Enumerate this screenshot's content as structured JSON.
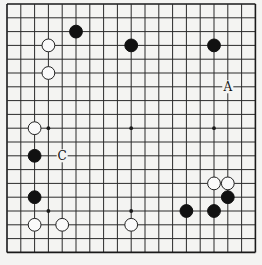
{
  "diagram": {
    "type": "go-board",
    "size": 19,
    "colors": {
      "background": "#f4f4f2",
      "line": "#2a2a2a",
      "black_stone": "#111111",
      "white_stone": "#fafafa"
    },
    "hoshi": [
      [
        3,
        3
      ],
      [
        9,
        3
      ],
      [
        15,
        3
      ],
      [
        3,
        9
      ],
      [
        9,
        9
      ],
      [
        15,
        9
      ],
      [
        3,
        15
      ],
      [
        9,
        15
      ],
      [
        15,
        15
      ]
    ],
    "stones": [
      {
        "color": "black",
        "col": 5,
        "row": 2
      },
      {
        "color": "white",
        "col": 3,
        "row": 3
      },
      {
        "color": "white",
        "col": 3,
        "row": 5
      },
      {
        "color": "black",
        "col": 9,
        "row": 3
      },
      {
        "color": "black",
        "col": 15,
        "row": 3
      },
      {
        "color": "white",
        "col": 2,
        "row": 9
      },
      {
        "color": "black",
        "col": 2,
        "row": 11
      },
      {
        "color": "black",
        "col": 2,
        "row": 14
      },
      {
        "color": "white",
        "col": 2,
        "row": 16
      },
      {
        "color": "white",
        "col": 4,
        "row": 16
      },
      {
        "color": "white",
        "col": 9,
        "row": 16
      },
      {
        "color": "white",
        "col": 15,
        "row": 13
      },
      {
        "color": "white",
        "col": 16,
        "row": 13
      },
      {
        "color": "black",
        "col": 16,
        "row": 14
      },
      {
        "color": "black",
        "col": 13,
        "row": 15
      },
      {
        "color": "black",
        "col": 15,
        "row": 15
      }
    ],
    "labels": [
      {
        "text": "A",
        "col": 16,
        "row": 6
      },
      {
        "text": "C",
        "col": 4,
        "row": 11
      }
    ]
  }
}
